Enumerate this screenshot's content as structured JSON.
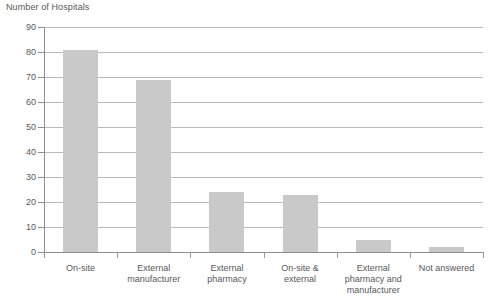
{
  "chart_data": {
    "type": "bar",
    "title": "Number of Hospitals",
    "ylabel": "Number of Hospitals",
    "xlabel": "",
    "categories": [
      "On-site",
      "External manufacturer",
      "External pharmacy",
      "On-site & external",
      "External pharmacy and manufacturer",
      "Not answered"
    ],
    "category_lines": [
      [
        "On-site"
      ],
      [
        "External",
        "manufacturer"
      ],
      [
        "External",
        "pharmacy"
      ],
      [
        "On-site &",
        "external"
      ],
      [
        "External",
        "pharmacy and",
        "manufacturer"
      ],
      [
        "Not answered"
      ]
    ],
    "values": [
      81,
      69,
      24,
      23,
      5,
      2
    ],
    "ylim": [
      0,
      90
    ],
    "ytick_step": 10,
    "yticks": [
      0,
      10,
      20,
      30,
      40,
      50,
      60,
      70,
      80,
      90
    ],
    "ytick_labels": [
      "0",
      "10",
      "20",
      "30",
      "40",
      "50",
      "60",
      "70",
      "80",
      "90"
    ],
    "grid": true,
    "legend": false,
    "legend_position": "none",
    "bar_color": "#c9c9c9",
    "gridline_color": "#b9b9bb",
    "axis_color": "#8e8e90",
    "text_color": "#58585a",
    "background_color": "#ffffff"
  }
}
